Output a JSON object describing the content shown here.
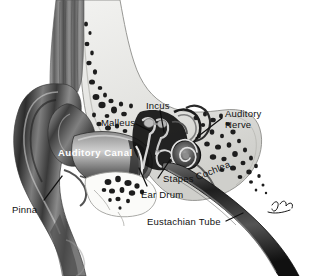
{
  "figure": {
    "type": "anatomical-illustration",
    "style": "grayscale halftone medical illustration",
    "background_color": "#ffffff",
    "text_color": "#121212",
    "inverse_text_color": "#ffffff",
    "signature": "Jose"
  },
  "labels": {
    "pinna": "Pinna",
    "auditory_canal": "Auditory Canal",
    "malleus": "Malleus",
    "incus": "Incus",
    "stapes": "Stapes",
    "ear_drum": "Ear Drum",
    "cochlea": "Cochlea",
    "auditory_nerve_line1": "Auditory",
    "auditory_nerve_line2": "Nerve",
    "eustachian_tube": "Eustachian Tube"
  }
}
